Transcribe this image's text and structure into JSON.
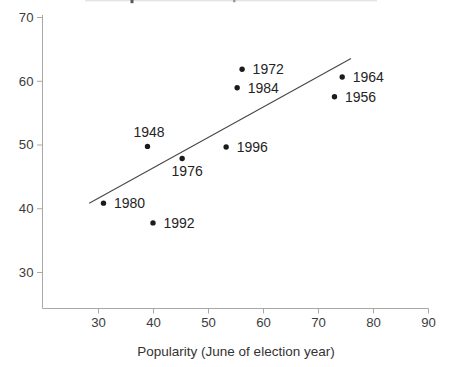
{
  "chart_data": {
    "type": "scatter",
    "title": "",
    "xlabel": "Popularity (June of election year)",
    "ylabel": "",
    "xlim": [
      19.8,
      90
    ],
    "ylim": [
      24.4,
      70.3
    ],
    "x_ticks": [
      30,
      40,
      50,
      60,
      70,
      80,
      90
    ],
    "y_ticks": [
      30,
      40,
      50,
      60,
      70
    ],
    "grid": false,
    "legend": "none",
    "points": [
      {
        "label": "1948",
        "x": 39.0,
        "y": 49.7,
        "label_pos": "above"
      },
      {
        "label": "1956",
        "x": 73.0,
        "y": 57.5,
        "label_pos": "right"
      },
      {
        "label": "1964",
        "x": 74.4,
        "y": 60.6,
        "label_pos": "right"
      },
      {
        "label": "1972",
        "x": 56.2,
        "y": 61.8,
        "label_pos": "right"
      },
      {
        "label": "1976",
        "x": 45.3,
        "y": 47.8,
        "label_pos": "below"
      },
      {
        "label": "1980",
        "x": 31.0,
        "y": 40.8,
        "label_pos": "right"
      },
      {
        "label": "1984",
        "x": 55.3,
        "y": 58.9,
        "label_pos": "right"
      },
      {
        "label": "1992",
        "x": 40.0,
        "y": 37.7,
        "label_pos": "right"
      },
      {
        "label": "1996",
        "x": 53.3,
        "y": 49.6,
        "label_pos": "right"
      }
    ],
    "trend_line": {
      "x1": 28.4,
      "y1": 40.8,
      "x2": 76.0,
      "y2": 63.5
    },
    "colors": {
      "axis": "#a8a8a8",
      "tick_label": "#3c3c3c",
      "point": "#1b1b1b",
      "year_label": "#242424",
      "trend": "#474747",
      "cropped_text_remnant": "#5a5a5a"
    }
  }
}
